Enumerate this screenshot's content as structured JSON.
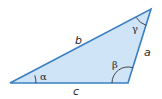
{
  "diagram": {
    "type": "triangle",
    "fill_color": "#cfe4f6",
    "stroke_color": "#3a7fc4",
    "arc_color": "#333333",
    "vertices": {
      "A": [
        10,
        83
      ],
      "B": [
        128,
        83
      ],
      "C": [
        151,
        9
      ]
    },
    "sides": {
      "a": "a",
      "b": "b",
      "c": "c"
    },
    "angles": {
      "alpha": "α",
      "beta": "β",
      "gamma": "γ"
    }
  }
}
